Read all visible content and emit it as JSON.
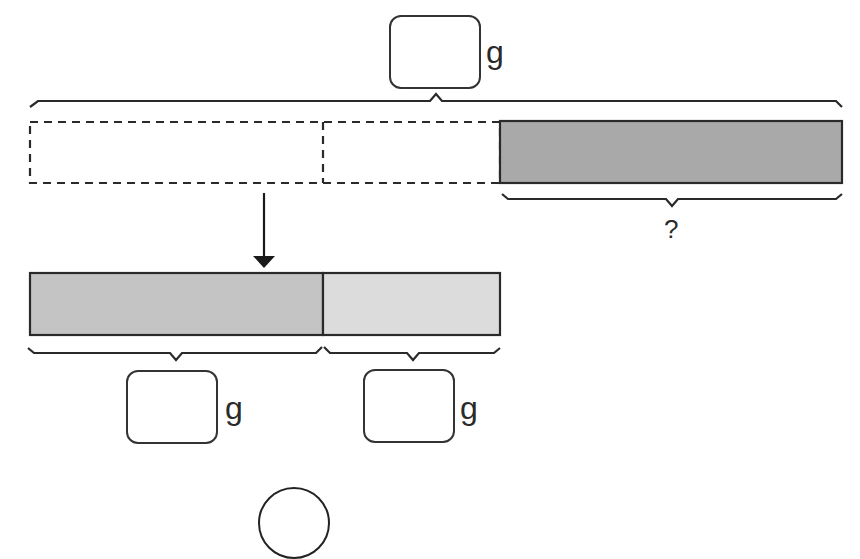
{
  "diagram": {
    "type": "bar-model",
    "colors": {
      "stroke": "#2a2a2a",
      "dark_gray_fill": "#a9a9a9",
      "mid_gray_fill": "#c4c4c4",
      "light_gray_fill": "#dcdcdc"
    },
    "top": {
      "total_box": {
        "value": "",
        "unit": "g"
      },
      "dashed_bar": {
        "segments": 2
      },
      "shaded_part": {
        "label": "?"
      }
    },
    "bottom": {
      "parts": [
        {
          "box_value": "",
          "unit": "g"
        },
        {
          "box_value": "",
          "unit": "g"
        }
      ]
    },
    "operator_circle": {
      "value": ""
    }
  }
}
